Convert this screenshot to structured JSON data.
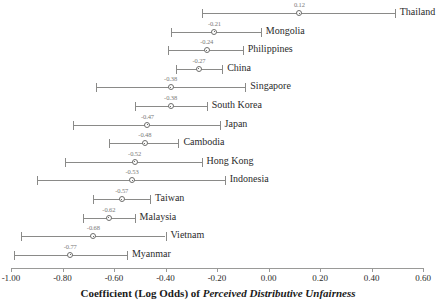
{
  "chart_data": {
    "type": "scatter",
    "subtype": "coefficient-plot-with-confidence-intervals",
    "title": "",
    "xlabel": "Coefficient (Log Odds) of Perceived Distributive Unfairness",
    "xlabel_plain": "Coefficient (Log Odds) of ",
    "xlabel_italic": "Perceived Distributive Unfairness",
    "ylabel": "",
    "xlim": [
      -1.0,
      0.6
    ],
    "grid": false,
    "legend": false,
    "xticks": [
      -1.0,
      -0.8,
      -0.6,
      -0.4,
      -0.2,
      0.0,
      0.2,
      0.4,
      0.6
    ],
    "xtick_labels": [
      "-1.00",
      "-0.80",
      "-0.60",
      "-0.40",
      "-0.20",
      "0.00",
      "0.20",
      "0.40",
      "0.60"
    ],
    "categories": [
      "Thailand",
      "Mongolia",
      "Philippines",
      "China",
      "Singapore",
      "South Korea",
      "Japan",
      "Cambodia",
      "Hong Kong",
      "Indonesia",
      "Taiwan",
      "Malaysia",
      "Vietnam",
      "Myanmar"
    ],
    "values": [
      0.12,
      -0.21,
      -0.24,
      -0.27,
      -0.38,
      -0.38,
      -0.47,
      -0.48,
      -0.52,
      -0.53,
      -0.57,
      -0.62,
      -0.68,
      -0.77
    ],
    "value_labels": [
      "0.12",
      "-0.21",
      "-0.24",
      "-0.27",
      "-0.38",
      "-0.38",
      "-0.47",
      "-0.48",
      "-0.52",
      "-0.53",
      "-0.57",
      "-0.62",
      "-0.68",
      "-0.77"
    ],
    "ci_low": [
      -0.26,
      -0.38,
      -0.39,
      -0.36,
      -0.67,
      -0.52,
      -0.76,
      -0.62,
      -0.79,
      -0.9,
      -0.68,
      -0.72,
      -0.96,
      -0.99
    ],
    "ci_high": [
      0.49,
      -0.03,
      -0.1,
      -0.18,
      -0.09,
      -0.24,
      -0.19,
      -0.35,
      -0.26,
      -0.17,
      -0.46,
      -0.52,
      -0.4,
      -0.55
    ],
    "points": [
      {
        "category": "Thailand",
        "value": 0.12,
        "label": "0.12",
        "ci_low": -0.26,
        "ci_high": 0.49
      },
      {
        "category": "Mongolia",
        "value": -0.21,
        "label": "-0.21",
        "ci_low": -0.38,
        "ci_high": -0.03
      },
      {
        "category": "Philippines",
        "value": -0.24,
        "label": "-0.24",
        "ci_low": -0.39,
        "ci_high": -0.1
      },
      {
        "category": "China",
        "value": -0.27,
        "label": "-0.27",
        "ci_low": -0.36,
        "ci_high": -0.18
      },
      {
        "category": "Singapore",
        "value": -0.38,
        "label": "-0.38",
        "ci_low": -0.67,
        "ci_high": -0.09
      },
      {
        "category": "South Korea",
        "value": -0.38,
        "label": "-0.38",
        "ci_low": -0.52,
        "ci_high": -0.24
      },
      {
        "category": "Japan",
        "value": -0.47,
        "label": "-0.47",
        "ci_low": -0.76,
        "ci_high": -0.19
      },
      {
        "category": "Cambodia",
        "value": -0.48,
        "label": "-0.48",
        "ci_low": -0.62,
        "ci_high": -0.35
      },
      {
        "category": "Hong Kong",
        "value": -0.52,
        "label": "-0.52",
        "ci_low": -0.79,
        "ci_high": -0.26
      },
      {
        "category": "Indonesia",
        "value": -0.53,
        "label": "-0.53",
        "ci_low": -0.9,
        "ci_high": -0.17
      },
      {
        "category": "Taiwan",
        "value": -0.57,
        "label": "-0.57",
        "ci_low": -0.68,
        "ci_high": -0.46
      },
      {
        "category": "Malaysia",
        "value": -0.62,
        "label": "-0.62",
        "ci_low": -0.72,
        "ci_high": -0.52
      },
      {
        "category": "Vietnam",
        "value": -0.68,
        "label": "-0.68",
        "ci_low": -0.96,
        "ci_high": -0.4
      },
      {
        "category": "Myanmar",
        "value": -0.77,
        "label": "-0.77",
        "ci_low": -0.99,
        "ci_high": -0.55
      }
    ],
    "colors": {
      "line": "#8a8a88",
      "marker_edge": "#6e6e6c",
      "marker_fill": "#ffffff",
      "value_label": "#7a7a78",
      "category_label": "#2b2b2b",
      "axis": "#9a9a98",
      "background": "#ffffff"
    }
  }
}
